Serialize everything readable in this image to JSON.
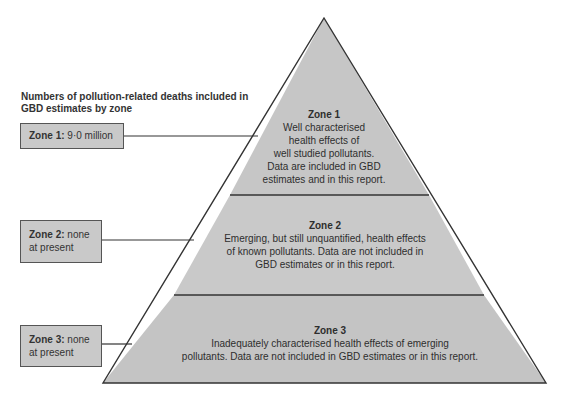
{
  "legend": {
    "title": "Numbers of pollution-related deaths included in GBD estimates by zone",
    "boxes": [
      {
        "label": "Zone 1:",
        "value": "9·0 million"
      },
      {
        "label": "Zone 2:",
        "value": "none at present"
      },
      {
        "label": "Zone 3:",
        "value": "none at present"
      }
    ]
  },
  "pyramid": {
    "colors": {
      "fill": "#c4c4c4",
      "stroke": "#333333",
      "box_fill": "#c9c9c9"
    },
    "zones": [
      {
        "title": "Zone 1",
        "description": "Well characterised health effects of well studied pollutants. Data are included in GBD estimates and in this report.",
        "lines": [
          "Well characterised",
          "health effects of",
          "well studied pollutants.",
          "Data are included in GBD",
          "estimates and in this report."
        ]
      },
      {
        "title": "Zone 2",
        "description": "Emerging, but still unquantified, health effects of known pollutants. Data are not included in GBD estimates or in this report.",
        "lines": [
          "Emerging, but still unquantified, health effects",
          "of known pollutants. Data are not included in",
          "GBD estimates or in this report."
        ]
      },
      {
        "title": "Zone 3",
        "description": "Inadequately characterised health effects of emerging pollutants. Data are not included in GBD estimates or in this report.",
        "lines": [
          "Inadequately characterised health effects of emerging",
          "pollutants. Data are not included in GBD estimates or in this report."
        ]
      }
    ]
  }
}
